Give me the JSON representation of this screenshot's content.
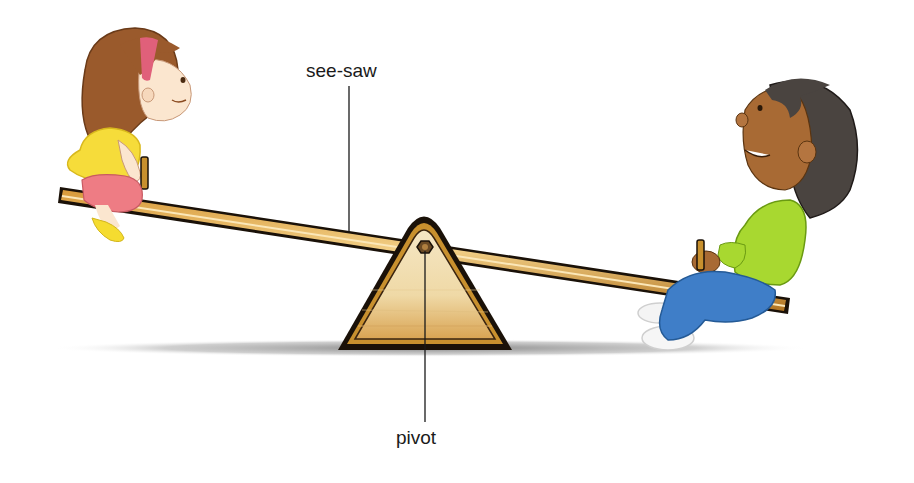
{
  "diagram": {
    "title": "",
    "labels": {
      "seesaw": "see-saw",
      "pivot": "pivot"
    },
    "parts": [
      {
        "id": "plank",
        "description": "wooden see-saw plank tilted down to the right"
      },
      {
        "id": "fulcrum",
        "description": "triangular wooden support with hexagonal bolt at apex"
      },
      {
        "id": "child-left",
        "description": "girl in yellow top and pink shorts, raised end"
      },
      {
        "id": "child-right",
        "description": "boy in green top and blue trousers, lowered end"
      }
    ],
    "colors": {
      "wood": "#c8902e",
      "wood_light": "#f0d9a8",
      "outline": "#1a1108",
      "shadow": "#9a9a9a",
      "girl_hair": "#9a5a2c",
      "girl_top": "#f6dc3a",
      "girl_shorts": "#ee7c84",
      "headband": "#e0607a",
      "boy_hair": "#4a4440",
      "boy_skin": "#a86a34",
      "boy_top": "#a8d830",
      "boy_trousers": "#3f7ec8",
      "leader_line": "#1a1a1a"
    }
  }
}
